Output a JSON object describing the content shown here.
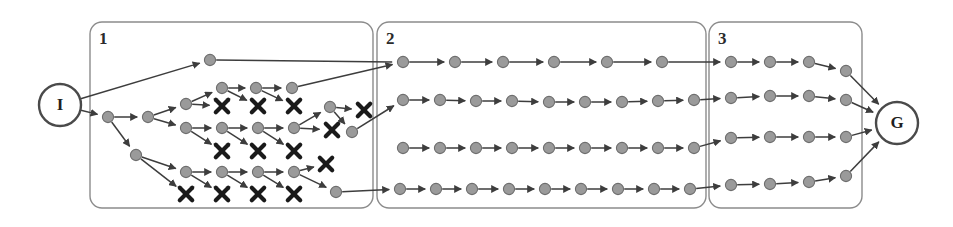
{
  "figure": {
    "background_color": "#ffffff",
    "node_fill": "#9a9a9a",
    "node_stroke": "#6e6e6e",
    "edge_color": "#3d3d3d",
    "dead_end_color": "#1a1a1a",
    "box_stroke": "#8c8c8c",
    "label_color": "#2b2b2b"
  },
  "endpoints": [
    {
      "id": "I",
      "label": "I",
      "name": "initial-state-node",
      "cx": 60,
      "cy": 105,
      "r": 21
    },
    {
      "id": "G",
      "label": "G",
      "name": "goal-state-node",
      "cx": 897,
      "cy": 123,
      "r": 21
    }
  ],
  "regions": [
    {
      "id": "region-1",
      "label": "1",
      "x": 90,
      "y": 22,
      "w": 283,
      "h": 186,
      "label_x": 99,
      "label_y": 30
    },
    {
      "id": "region-2",
      "label": "2",
      "x": 377,
      "y": 22,
      "w": 329,
      "h": 186,
      "label_x": 386,
      "label_y": 30
    },
    {
      "id": "region-3",
      "label": "3",
      "x": 709,
      "y": 22,
      "w": 153,
      "h": 186,
      "label_x": 718,
      "label_y": 30
    }
  ],
  "nodes": [
    {
      "id": "n_top1",
      "x": 210,
      "y": 60,
      "region": 1
    },
    {
      "id": "a0",
      "x": 108,
      "y": 117,
      "region": 1
    },
    {
      "id": "a1",
      "x": 148,
      "y": 117,
      "region": 1
    },
    {
      "id": "b0",
      "x": 186,
      "y": 104,
      "region": 1
    },
    {
      "id": "c0",
      "x": 222,
      "y": 88,
      "region": 1
    },
    {
      "id": "c1",
      "x": 256,
      "y": 88,
      "region": 1
    },
    {
      "id": "c2",
      "x": 292,
      "y": 88,
      "region": 1
    },
    {
      "id": "d0",
      "x": 186,
      "y": 128,
      "region": 1
    },
    {
      "id": "d1",
      "x": 222,
      "y": 128,
      "region": 1
    },
    {
      "id": "d2",
      "x": 258,
      "y": 128,
      "region": 1
    },
    {
      "id": "d3",
      "x": 294,
      "y": 128,
      "region": 1
    },
    {
      "id": "e0",
      "x": 136,
      "y": 155,
      "region": 1
    },
    {
      "id": "f0",
      "x": 186,
      "y": 172,
      "region": 1
    },
    {
      "id": "f1",
      "x": 222,
      "y": 172,
      "region": 1
    },
    {
      "id": "f2",
      "x": 258,
      "y": 172,
      "region": 1
    },
    {
      "id": "f3",
      "x": 294,
      "y": 172,
      "region": 1
    },
    {
      "id": "g0",
      "x": 330,
      "y": 107,
      "region": 1
    },
    {
      "id": "g1",
      "x": 352,
      "y": 132,
      "region": 1
    },
    {
      "id": "h0",
      "x": 336,
      "y": 192,
      "region": 1
    },
    {
      "id": "r2a1",
      "x": 403,
      "y": 62,
      "region": 2
    },
    {
      "id": "r2a2",
      "x": 455,
      "y": 62,
      "region": 2
    },
    {
      "id": "r2a3",
      "x": 503,
      "y": 62,
      "region": 2
    },
    {
      "id": "r2a4",
      "x": 554,
      "y": 62,
      "region": 2
    },
    {
      "id": "r2a5",
      "x": 607,
      "y": 62,
      "region": 2
    },
    {
      "id": "r2a6",
      "x": 662,
      "y": 62,
      "region": 2
    },
    {
      "id": "r2b1",
      "x": 403,
      "y": 100,
      "region": 2
    },
    {
      "id": "r2b2",
      "x": 440,
      "y": 100,
      "region": 2
    },
    {
      "id": "r2b3",
      "x": 476,
      "y": 101,
      "region": 2
    },
    {
      "id": "r2b4",
      "x": 512,
      "y": 101,
      "region": 2
    },
    {
      "id": "r2b5",
      "x": 549,
      "y": 102,
      "region": 2
    },
    {
      "id": "r2b6",
      "x": 585,
      "y": 102,
      "region": 2
    },
    {
      "id": "r2b7",
      "x": 622,
      "y": 102,
      "region": 2
    },
    {
      "id": "r2b8",
      "x": 658,
      "y": 101,
      "region": 2
    },
    {
      "id": "r2b9",
      "x": 694,
      "y": 100,
      "region": 2
    },
    {
      "id": "r2c1",
      "x": 403,
      "y": 148,
      "region": 2
    },
    {
      "id": "r2c2",
      "x": 440,
      "y": 148,
      "region": 2
    },
    {
      "id": "r2c3",
      "x": 476,
      "y": 148,
      "region": 2
    },
    {
      "id": "r2c4",
      "x": 512,
      "y": 148,
      "region": 2
    },
    {
      "id": "r2c5",
      "x": 549,
      "y": 148,
      "region": 2
    },
    {
      "id": "r2c6",
      "x": 585,
      "y": 148,
      "region": 2
    },
    {
      "id": "r2c7",
      "x": 622,
      "y": 148,
      "region": 2
    },
    {
      "id": "r2c8",
      "x": 658,
      "y": 148,
      "region": 2
    },
    {
      "id": "r2c9",
      "x": 694,
      "y": 148,
      "region": 2
    },
    {
      "id": "r2d1",
      "x": 400,
      "y": 189,
      "region": 2
    },
    {
      "id": "r2d2",
      "x": 436,
      "y": 189,
      "region": 2
    },
    {
      "id": "r2d3",
      "x": 472,
      "y": 189,
      "region": 2
    },
    {
      "id": "r2d4",
      "x": 509,
      "y": 189,
      "region": 2
    },
    {
      "id": "r2d5",
      "x": 545,
      "y": 189,
      "region": 2
    },
    {
      "id": "r2d6",
      "x": 581,
      "y": 189,
      "region": 2
    },
    {
      "id": "r2d7",
      "x": 618,
      "y": 189,
      "region": 2
    },
    {
      "id": "r2d8",
      "x": 654,
      "y": 189,
      "region": 2
    },
    {
      "id": "r2d9",
      "x": 690,
      "y": 189,
      "region": 2
    },
    {
      "id": "r3a1",
      "x": 731,
      "y": 62,
      "region": 3
    },
    {
      "id": "r3a2",
      "x": 770,
      "y": 62,
      "region": 3
    },
    {
      "id": "r3a3",
      "x": 809,
      "y": 62,
      "region": 3
    },
    {
      "id": "r3a4",
      "x": 846,
      "y": 71,
      "region": 3
    },
    {
      "id": "r3b1",
      "x": 731,
      "y": 98,
      "region": 3
    },
    {
      "id": "r3b2",
      "x": 770,
      "y": 96,
      "region": 3
    },
    {
      "id": "r3b3",
      "x": 809,
      "y": 96,
      "region": 3
    },
    {
      "id": "r3b4",
      "x": 846,
      "y": 100,
      "region": 3
    },
    {
      "id": "r3c1",
      "x": 731,
      "y": 138,
      "region": 3
    },
    {
      "id": "r3c2",
      "x": 770,
      "y": 137,
      "region": 3
    },
    {
      "id": "r3c3",
      "x": 809,
      "y": 137,
      "region": 3
    },
    {
      "id": "r3c4",
      "x": 846,
      "y": 137,
      "region": 3
    },
    {
      "id": "r3d1",
      "x": 731,
      "y": 185,
      "region": 3
    },
    {
      "id": "r3d2",
      "x": 770,
      "y": 184,
      "region": 3
    },
    {
      "id": "r3d3",
      "x": 809,
      "y": 182,
      "region": 3
    },
    {
      "id": "r3d4",
      "x": 846,
      "y": 176,
      "region": 3
    }
  ],
  "dead_ends": [
    {
      "id": "x1",
      "x": 222,
      "y": 106
    },
    {
      "id": "x2",
      "x": 258,
      "y": 106
    },
    {
      "id": "x3",
      "x": 294,
      "y": 106
    },
    {
      "id": "x4",
      "x": 222,
      "y": 151
    },
    {
      "id": "x5",
      "x": 258,
      "y": 151
    },
    {
      "id": "x6",
      "x": 294,
      "y": 151
    },
    {
      "id": "x7",
      "x": 186,
      "y": 194
    },
    {
      "id": "x8",
      "x": 222,
      "y": 194
    },
    {
      "id": "x9",
      "x": 258,
      "y": 194
    },
    {
      "id": "x10",
      "x": 294,
      "y": 194
    },
    {
      "id": "x11",
      "x": 364,
      "y": 110
    },
    {
      "id": "x12",
      "x": 332,
      "y": 130
    },
    {
      "id": "x13",
      "x": 326,
      "y": 164
    }
  ],
  "edges": [
    {
      "from": "I",
      "to": "n_top1",
      "kind": "solid"
    },
    {
      "from": "I",
      "to": "a0",
      "kind": "solid"
    },
    {
      "from": "a0",
      "to": "a1",
      "kind": "solid"
    },
    {
      "from": "a0",
      "to": "e0",
      "kind": "solid"
    },
    {
      "from": "a1",
      "to": "b0",
      "kind": "solid"
    },
    {
      "from": "a1",
      "to": "d0",
      "kind": "solid"
    },
    {
      "from": "b0",
      "to": "c0",
      "kind": "solid"
    },
    {
      "from": "b0",
      "to": "x1",
      "kind": "dead"
    },
    {
      "from": "c0",
      "to": "c1",
      "kind": "solid"
    },
    {
      "from": "c0",
      "to": "x2",
      "kind": "dead"
    },
    {
      "from": "c1",
      "to": "c2",
      "kind": "solid"
    },
    {
      "from": "c1",
      "to": "x3",
      "kind": "dead"
    },
    {
      "from": "c2",
      "to": "r2a1",
      "kind": "solid"
    },
    {
      "from": "d0",
      "to": "d1",
      "kind": "solid"
    },
    {
      "from": "d0",
      "to": "x4",
      "kind": "dead"
    },
    {
      "from": "d1",
      "to": "d2",
      "kind": "solid"
    },
    {
      "from": "d1",
      "to": "x5",
      "kind": "dead"
    },
    {
      "from": "d2",
      "to": "d3",
      "kind": "solid"
    },
    {
      "from": "d2",
      "to": "x6",
      "kind": "dead"
    },
    {
      "from": "d3",
      "to": "g0",
      "kind": "solid"
    },
    {
      "from": "d3",
      "to": "x12",
      "kind": "dead"
    },
    {
      "from": "g0",
      "to": "x11",
      "kind": "dead"
    },
    {
      "from": "g0",
      "to": "g1",
      "kind": "solid"
    },
    {
      "from": "g1",
      "to": "r2b1",
      "kind": "solid"
    },
    {
      "from": "e0",
      "to": "f0",
      "kind": "solid"
    },
    {
      "from": "e0",
      "to": "x7",
      "kind": "dead"
    },
    {
      "from": "f0",
      "to": "f1",
      "kind": "solid"
    },
    {
      "from": "f0",
      "to": "x8",
      "kind": "dead"
    },
    {
      "from": "f1",
      "to": "f2",
      "kind": "solid"
    },
    {
      "from": "f1",
      "to": "x9",
      "kind": "dead"
    },
    {
      "from": "f2",
      "to": "f3",
      "kind": "solid"
    },
    {
      "from": "f2",
      "to": "x10",
      "kind": "dead"
    },
    {
      "from": "f3",
      "to": "x13",
      "kind": "dead"
    },
    {
      "from": "f3",
      "to": "h0",
      "kind": "solid"
    },
    {
      "from": "h0",
      "to": "r2d1",
      "kind": "solid"
    },
    {
      "from": "n_top1",
      "to": "r2a1",
      "kind": "plain"
    },
    {
      "from": "r2a1",
      "to": "r2a2",
      "kind": "solid"
    },
    {
      "from": "r2a2",
      "to": "r2a3",
      "kind": "solid"
    },
    {
      "from": "r2a3",
      "to": "r2a4",
      "kind": "solid"
    },
    {
      "from": "r2a4",
      "to": "r2a5",
      "kind": "solid"
    },
    {
      "from": "r2a5",
      "to": "r2a6",
      "kind": "solid"
    },
    {
      "from": "r2a6",
      "to": "r3a1",
      "kind": "solid"
    },
    {
      "from": "r2b1",
      "to": "r2b2",
      "kind": "solid"
    },
    {
      "from": "r2b2",
      "to": "r2b3",
      "kind": "solid"
    },
    {
      "from": "r2b3",
      "to": "r2b4",
      "kind": "solid"
    },
    {
      "from": "r2b4",
      "to": "r2b5",
      "kind": "solid"
    },
    {
      "from": "r2b5",
      "to": "r2b6",
      "kind": "solid"
    },
    {
      "from": "r2b6",
      "to": "r2b7",
      "kind": "solid"
    },
    {
      "from": "r2b7",
      "to": "r2b8",
      "kind": "solid"
    },
    {
      "from": "r2b8",
      "to": "r2b9",
      "kind": "solid"
    },
    {
      "from": "r2b9",
      "to": "r3b1",
      "kind": "solid"
    },
    {
      "from": "r2c1",
      "to": "r2c2",
      "kind": "solid"
    },
    {
      "from": "r2c2",
      "to": "r2c3",
      "kind": "solid"
    },
    {
      "from": "r2c3",
      "to": "r2c4",
      "kind": "solid"
    },
    {
      "from": "r2c4",
      "to": "r2c5",
      "kind": "solid"
    },
    {
      "from": "r2c5",
      "to": "r2c6",
      "kind": "solid"
    },
    {
      "from": "r2c6",
      "to": "r2c7",
      "kind": "solid"
    },
    {
      "from": "r2c7",
      "to": "r2c8",
      "kind": "solid"
    },
    {
      "from": "r2c8",
      "to": "r2c9",
      "kind": "solid"
    },
    {
      "from": "r2c9",
      "to": "r3c1",
      "kind": "solid"
    },
    {
      "from": "r2d1",
      "to": "r2d2",
      "kind": "solid"
    },
    {
      "from": "r2d2",
      "to": "r2d3",
      "kind": "solid"
    },
    {
      "from": "r2d3",
      "to": "r2d4",
      "kind": "solid"
    },
    {
      "from": "r2d4",
      "to": "r2d5",
      "kind": "solid"
    },
    {
      "from": "r2d5",
      "to": "r2d6",
      "kind": "solid"
    },
    {
      "from": "r2d6",
      "to": "r2d7",
      "kind": "solid"
    },
    {
      "from": "r2d7",
      "to": "r2d8",
      "kind": "solid"
    },
    {
      "from": "r2d8",
      "to": "r2d9",
      "kind": "solid"
    },
    {
      "from": "r2d9",
      "to": "r3d1",
      "kind": "solid"
    },
    {
      "from": "r3a1",
      "to": "r3a2",
      "kind": "solid"
    },
    {
      "from": "r3a2",
      "to": "r3a3",
      "kind": "solid"
    },
    {
      "from": "r3a3",
      "to": "r3a4",
      "kind": "solid"
    },
    {
      "from": "r3a4",
      "to": "G",
      "kind": "solid"
    },
    {
      "from": "r3b1",
      "to": "r3b2",
      "kind": "solid"
    },
    {
      "from": "r3b2",
      "to": "r3b3",
      "kind": "solid"
    },
    {
      "from": "r3b3",
      "to": "r3b4",
      "kind": "solid"
    },
    {
      "from": "r3b4",
      "to": "G",
      "kind": "solid"
    },
    {
      "from": "r3c1",
      "to": "r3c2",
      "kind": "solid"
    },
    {
      "from": "r3c2",
      "to": "r3c3",
      "kind": "solid"
    },
    {
      "from": "r3c3",
      "to": "r3c4",
      "kind": "solid"
    },
    {
      "from": "r3c4",
      "to": "G",
      "kind": "solid"
    },
    {
      "from": "r3d1",
      "to": "r3d2",
      "kind": "solid"
    },
    {
      "from": "r3d2",
      "to": "r3d3",
      "kind": "solid"
    },
    {
      "from": "r3d3",
      "to": "r3d4",
      "kind": "solid"
    },
    {
      "from": "r3d4",
      "to": "G",
      "kind": "solid"
    }
  ]
}
